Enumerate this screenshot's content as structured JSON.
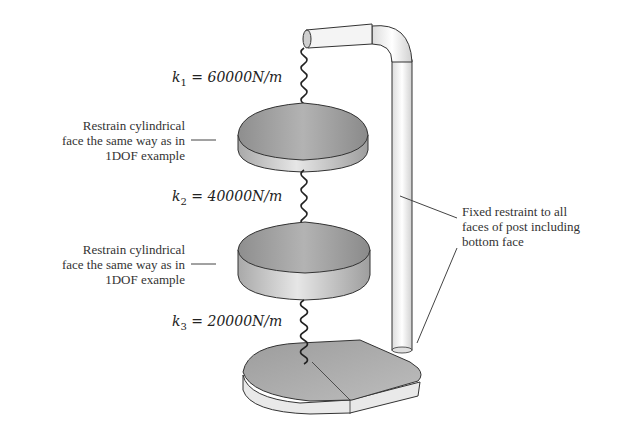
{
  "diagram": {
    "type": "mechanical-2dof-spring-mass-system",
    "springs": [
      {
        "symbol": "k",
        "index": "1",
        "value": "60000",
        "unit": "N/m"
      },
      {
        "symbol": "k",
        "index": "2",
        "value": "40000",
        "unit": "N/m"
      },
      {
        "symbol": "k",
        "index": "3",
        "value": "20000",
        "unit": "N/m"
      }
    ],
    "notes": {
      "mass_top": [
        "Restrain cylindrical",
        "face the same way as in",
        "1DOF example"
      ],
      "mass_bottom": [
        "Restrain cylindrical",
        "face the same way as in",
        "1DOF example"
      ],
      "post": [
        "Fixed restraint to all",
        "faces of post including",
        "bottom face"
      ]
    },
    "colors": {
      "mass_top": "#9a9a9a",
      "mass_side": "#cfcfcf",
      "post": "#f2f2f2",
      "outline": "#333333",
      "leader": "#444444"
    }
  }
}
